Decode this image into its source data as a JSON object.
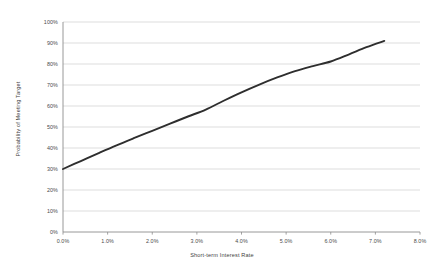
{
  "chart_data": {
    "type": "line",
    "title": "",
    "xlabel": "Short-term Interest Rate",
    "ylabel": "Probability of Meeting Target",
    "xlim": [
      0.0,
      8.0
    ],
    "ylim": [
      0,
      100
    ],
    "grid": "horizontal",
    "legend": "none",
    "x_tick_labels": [
      "0.0%",
      "1.0%",
      "2.0%",
      "3.0%",
      "4.0%",
      "5.0%",
      "6.0%",
      "7.0%",
      "8.0%"
    ],
    "x_tick_values": [
      0.0,
      1.0,
      2.0,
      3.0,
      4.0,
      5.0,
      6.0,
      7.0,
      8.0
    ],
    "y_tick_labels": [
      "0%",
      "10%",
      "20%",
      "30%",
      "40%",
      "50%",
      "60%",
      "70%",
      "80%",
      "90%",
      "100%"
    ],
    "y_tick_values": [
      0,
      10,
      20,
      30,
      40,
      50,
      60,
      70,
      80,
      90,
      100
    ],
    "series": [
      {
        "name": "Probability of Meeting Target",
        "color": "#2e2e2e",
        "line_width": 1.9,
        "x": [
          0.0,
          0.4,
          0.8,
          1.2,
          1.6,
          2.0,
          2.4,
          2.8,
          3.2,
          3.6,
          4.0,
          4.4,
          4.8,
          5.2,
          5.6,
          6.0,
          6.4,
          6.8,
          7.2
        ],
        "values": [
          30.0,
          33.8,
          37.6,
          41.3,
          44.8,
          48.2,
          51.6,
          55.0,
          58.3,
          62.5,
          66.5,
          70.2,
          73.6,
          76.6,
          79.0,
          81.2,
          84.5,
          88.0,
          91.0
        ]
      }
    ],
    "colors": {
      "gridline": "#d4d4d4",
      "axis": "#8c8c8c",
      "line": "#2e2e2e",
      "text": "#4a4a4a",
      "background": "#ffffff"
    }
  }
}
